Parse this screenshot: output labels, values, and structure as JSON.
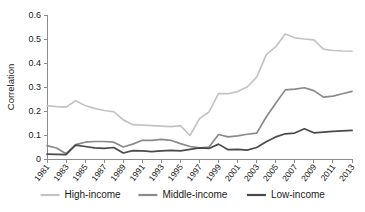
{
  "chart_data": {
    "type": "line",
    "title": "",
    "xlabel": "",
    "ylabel": "Correlation",
    "ylim": [
      0,
      0.6
    ],
    "yticks": [
      0,
      0.1,
      0.2,
      0.3,
      0.4,
      0.5,
      0.6
    ],
    "ytick_labels": [
      "0",
      "0.1",
      "0.2",
      "0.3",
      "0.4",
      "0.5",
      "0.6"
    ],
    "grid": false,
    "legend_position": "bottom",
    "x": [
      1981,
      1982,
      1983,
      1984,
      1985,
      1986,
      1987,
      1988,
      1989,
      1990,
      1991,
      1992,
      1993,
      1994,
      1995,
      1996,
      1997,
      1998,
      1999,
      2000,
      2001,
      2002,
      2003,
      2004,
      2005,
      2006,
      2007,
      2008,
      2009,
      2010,
      2011,
      2012,
      2013
    ],
    "xtick_labels": [
      "1981",
      "1983",
      "1985",
      "1987",
      "1989",
      "1991",
      "1993",
      "1995",
      "1997",
      "1999",
      "2001",
      "2003",
      "2005",
      "2007",
      "2009",
      "2011",
      "2013"
    ],
    "xticks": [
      1981,
      1983,
      1985,
      1987,
      1989,
      1991,
      1993,
      1995,
      1997,
      1999,
      2001,
      2003,
      2005,
      2007,
      2009,
      2011,
      2013
    ],
    "series": [
      {
        "name": "High-income",
        "color": "#c4c4c4",
        "values": [
          0.222,
          0.218,
          0.216,
          0.243,
          0.223,
          0.211,
          0.202,
          0.197,
          0.163,
          0.143,
          0.141,
          0.139,
          0.137,
          0.135,
          0.139,
          0.098,
          0.168,
          0.196,
          0.273,
          0.272,
          0.281,
          0.3,
          0.341,
          0.434,
          0.468,
          0.521,
          0.505,
          0.5,
          0.496,
          0.458,
          0.452,
          0.45,
          0.449
        ]
      },
      {
        "name": "Middle-income",
        "color": "#8a8a8a",
        "values": [
          0.056,
          0.046,
          0.022,
          0.06,
          0.07,
          0.073,
          0.073,
          0.07,
          0.05,
          0.062,
          0.078,
          0.078,
          0.082,
          0.078,
          0.064,
          0.052,
          0.046,
          0.05,
          0.102,
          0.092,
          0.096,
          0.103,
          0.108,
          0.175,
          0.232,
          0.288,
          0.291,
          0.297,
          0.285,
          0.258,
          0.262,
          0.272,
          0.282
        ]
      },
      {
        "name": "Low-income",
        "color": "#4a4a4a",
        "values": [
          0.02,
          0.019,
          0.018,
          0.058,
          0.052,
          0.046,
          0.044,
          0.048,
          0.025,
          0.035,
          0.034,
          0.031,
          0.034,
          0.036,
          0.034,
          0.04,
          0.046,
          0.044,
          0.062,
          0.039,
          0.04,
          0.037,
          0.048,
          0.072,
          0.092,
          0.105,
          0.108,
          0.126,
          0.109,
          0.112,
          0.115,
          0.117,
          0.119
        ]
      }
    ]
  },
  "legend": {
    "items": [
      {
        "label": "High-income"
      },
      {
        "label": "Middle-income"
      },
      {
        "label": "Low-income"
      }
    ]
  }
}
